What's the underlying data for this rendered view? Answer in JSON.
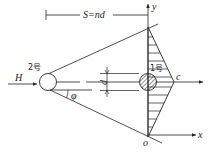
{
  "diagram": {
    "labels": {
      "spacing": "S=nd",
      "y_axis": "y",
      "x_axis": "x",
      "origin": "o",
      "point_c": "c",
      "diameter": "d",
      "flow": "H",
      "angle": "φ",
      "cylinder_upstream": "2号",
      "cylinder_downstream": "1号"
    },
    "colors": {
      "line": "#222222",
      "background": "#ffffff"
    }
  }
}
